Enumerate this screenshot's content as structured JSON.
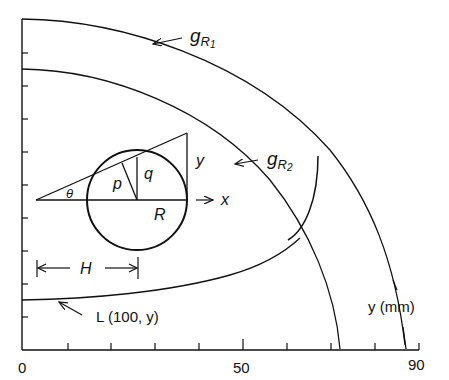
{
  "figure": {
    "x_axis": {
      "tick_labels": [
        "0",
        "50",
        "90"
      ],
      "ticks": [
        0,
        10,
        20,
        30,
        40,
        50,
        60,
        70,
        80,
        90
      ],
      "range": [
        0,
        90
      ]
    },
    "y_axis": {
      "tick_count": 10
    },
    "labels": {
      "g_r1": "g",
      "g_r1_sub": "R",
      "g_r1_subsub": "1",
      "g_r2": "g",
      "g_r2_sub": "R",
      "g_r2_subsub": "2",
      "theta": "θ",
      "p": "p",
      "q": "q",
      "y_side": "y",
      "x_arrow": "x",
      "R": "R",
      "H": "H",
      "L_curve": "L (100, y)",
      "y_mm": "y (mm)"
    },
    "colors": {
      "stroke": "#111111",
      "background": "#ffffff"
    }
  }
}
